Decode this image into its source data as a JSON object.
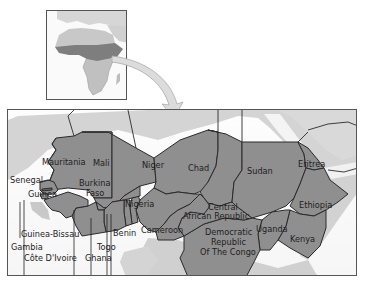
{
  "inset": {
    "title": "Africa locator",
    "highlight_color": "#8a8a8a",
    "land_color": "#c4c4c4"
  },
  "arrow": {
    "color": "#d8d8d8",
    "outline": "#a8a8a8"
  },
  "main_map": {
    "highlight_color": "#8f8f8f",
    "land_color": "#d2d2d2",
    "water_color": "#ffffff",
    "border_color": "#2a2a2a",
    "countries": [
      {
        "name": "Mauritania",
        "label": "Mauritania"
      },
      {
        "name": "Mali",
        "label": "Mali"
      },
      {
        "name": "Niger",
        "label": "Niger"
      },
      {
        "name": "Chad",
        "label": "Chad"
      },
      {
        "name": "Sudan",
        "label": "Sudan"
      },
      {
        "name": "Eritrea",
        "label": "Eritrea"
      },
      {
        "name": "Ethiopia",
        "label": "Ethiopia"
      },
      {
        "name": "Senegal",
        "label": "Senegal"
      },
      {
        "name": "Guinea",
        "label": "Guinea"
      },
      {
        "name": "Burkina Faso",
        "label_line1": "Burkina",
        "label_line2": "Faso"
      },
      {
        "name": "Nigeria",
        "label": "Nigeria"
      },
      {
        "name": "Central African Republic",
        "label_line1": "Central",
        "label_line2": "African Republic"
      },
      {
        "name": "Cameroon",
        "label": "Cameroon"
      },
      {
        "name": "Benin",
        "label": "Benin"
      },
      {
        "name": "Democratic Republic Of The Congo",
        "label_line1": "Democratic",
        "label_line2": "Republic",
        "label_line3": "Of The Congo"
      },
      {
        "name": "Uganda",
        "label": "Uganda"
      },
      {
        "name": "Kenya",
        "label": "Kenya"
      },
      {
        "name": "Guinea-Bissau",
        "label": "Guinea-Bissau"
      },
      {
        "name": "Gambia",
        "label": "Gambia"
      },
      {
        "name": "Togo",
        "label": "Togo"
      },
      {
        "name": "Côte D'Ivoire",
        "label": "Côte D'Ivoire"
      },
      {
        "name": "Ghana",
        "label": "Ghana"
      }
    ]
  }
}
